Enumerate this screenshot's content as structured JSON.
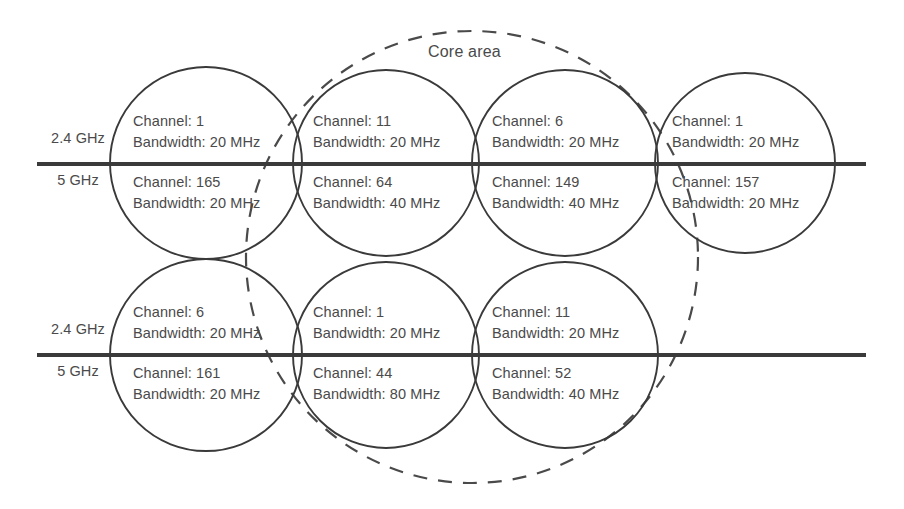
{
  "figure": {
    "core_area_label": "Core area",
    "stroke_color": "#3a3a3a",
    "text_color": "#4a4a4a",
    "background": "#ffffff"
  },
  "band_labels": {
    "upper": "2.4 GHz",
    "lower": "5 GHz"
  },
  "rows": [
    {
      "row_id": "row-top",
      "band_24": "2.4 GHz",
      "band_5": "5 GHz",
      "cells": [
        {
          "id": "ap-top-1",
          "upper": {
            "channel": "Channel: 1",
            "bandwidth": "Bandwidth: 20 MHz"
          },
          "lower": {
            "channel": "Channel: 165",
            "bandwidth": "Bandwidth: 20 MHz"
          }
        },
        {
          "id": "ap-top-2",
          "upper": {
            "channel": "Channel: 11",
            "bandwidth": "Bandwidth: 20 MHz"
          },
          "lower": {
            "channel": "Channel: 64",
            "bandwidth": "Bandwidth: 40 MHz"
          }
        },
        {
          "id": "ap-top-3",
          "upper": {
            "channel": "Channel: 6",
            "bandwidth": "Bandwidth: 20 MHz"
          },
          "lower": {
            "channel": "Channel: 149",
            "bandwidth": "Bandwidth: 40 MHz"
          }
        },
        {
          "id": "ap-top-4",
          "upper": {
            "channel": "Channel: 1",
            "bandwidth": "Bandwidth: 20 MHz"
          },
          "lower": {
            "channel": "Channel: 157",
            "bandwidth": "Bandwidth: 20 MHz"
          }
        }
      ]
    },
    {
      "row_id": "row-bottom",
      "band_24": "2.4 GHz",
      "band_5": "5 GHz",
      "cells": [
        {
          "id": "ap-bottom-1",
          "upper": {
            "channel": "Channel: 6",
            "bandwidth": "Bandwidth: 20 MHz"
          },
          "lower": {
            "channel": "Channel: 161",
            "bandwidth": "Bandwidth: 20 MHz"
          }
        },
        {
          "id": "ap-bottom-2",
          "upper": {
            "channel": "Channel: 1",
            "bandwidth": "Bandwidth: 20 MHz"
          },
          "lower": {
            "channel": "Channel: 44",
            "bandwidth": "Bandwidth: 80 MHz"
          }
        },
        {
          "id": "ap-bottom-3",
          "upper": {
            "channel": "Channel: 11",
            "bandwidth": "Bandwidth: 20 MHz"
          },
          "lower": {
            "channel": "Channel: 52",
            "bandwidth": "Bandwidth: 40 MHz"
          }
        }
      ]
    }
  ]
}
